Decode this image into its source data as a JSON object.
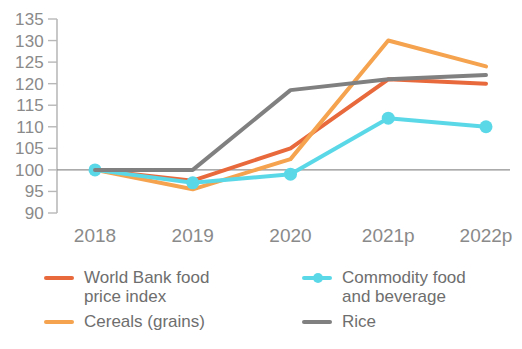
{
  "chart_data": {
    "type": "line",
    "title": "",
    "subtitle": "",
    "xlabel": "",
    "ylabel": "",
    "categories": [
      "2018",
      "2019",
      "2020",
      "2021p",
      "2022p"
    ],
    "ylim": [
      90,
      135
    ],
    "yticks": [
      90,
      95,
      100,
      105,
      110,
      115,
      120,
      125,
      130,
      135
    ],
    "ytick_labels": [
      "90",
      "95",
      "100",
      "105",
      "110",
      "115",
      "120",
      "125",
      "130",
      "135"
    ],
    "grid": false,
    "reference_line": 100,
    "legend_position": "bottom",
    "series": [
      {
        "name": "World Bank food price index",
        "color": "#E8693C",
        "markers": false,
        "values": [
          100,
          97.5,
          105,
          121,
          120
        ]
      },
      {
        "name": "Cereals (grains)",
        "color": "#F5A34E",
        "markers": false,
        "values": [
          100,
          95.5,
          102.5,
          130,
          124
        ]
      },
      {
        "name": "Commodity food and beverage",
        "color": "#5BD8E8",
        "markers": true,
        "values": [
          100,
          97,
          99,
          112,
          110
        ]
      },
      {
        "name": "Rice",
        "color": "#808080",
        "markers": false,
        "values": [
          100,
          100,
          118.5,
          121,
          122
        ]
      }
    ]
  },
  "legend": {
    "items": [
      {
        "label": "World Bank food\nprice index",
        "color": "#E8693C",
        "marker": false
      },
      {
        "label": "Commodity food\nand beverage",
        "color": "#5BD8E8",
        "marker": true
      },
      {
        "label": "Cereals (grains)",
        "color": "#F5A34E",
        "marker": false
      },
      {
        "label": "Rice",
        "color": "#808080",
        "marker": false
      }
    ]
  },
  "axis": {
    "tick_color": "#b8b8b8",
    "label_color": "#8a8a8a",
    "axis_color": "#b0b0b0"
  }
}
